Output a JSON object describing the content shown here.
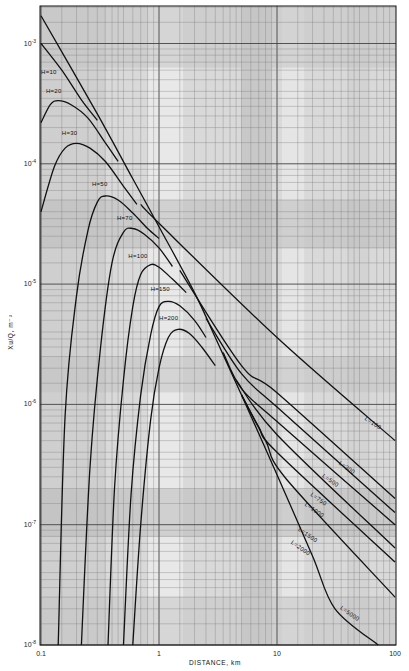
{
  "chart_data": {
    "type": "line",
    "title": "",
    "xlabel": "DISTANCE, km",
    "ylabel": "Xu/Q, m^-2",
    "xscale": "log",
    "yscale": "log",
    "xlim": [
      0.1,
      100
    ],
    "ylim": [
      1e-08,
      0.002
    ],
    "grid": true,
    "legend": "none (curves labeled inline)",
    "x_ticks": [
      {
        "value": 0.1,
        "label": "0.1"
      },
      {
        "value": 1,
        "label": "1"
      },
      {
        "value": 10,
        "label": "10"
      },
      {
        "value": 100,
        "label": "100"
      }
    ],
    "y_ticks": [
      {
        "value": 0.001,
        "base": "10",
        "exp": "-3"
      },
      {
        "value": 0.0001,
        "base": "10",
        "exp": "-4"
      },
      {
        "value": 1e-05,
        "base": "10",
        "exp": "-5"
      },
      {
        "value": 1e-06,
        "base": "10",
        "exp": "-6"
      },
      {
        "value": 1e-07,
        "base": "10",
        "exp": "-7"
      },
      {
        "value": 1e-08,
        "base": "10",
        "exp": "-8"
      }
    ],
    "series": [
      {
        "name": "Envelope (ground level)",
        "label": "",
        "points": [
          [
            0.1,
            0.0017
          ],
          [
            0.3,
            0.00026
          ],
          [
            0.6,
            7.5e-05
          ],
          [
            1,
            3e-05
          ],
          [
            2,
            8.5e-06
          ],
          [
            3,
            3.6e-06
          ],
          [
            5,
            1.2e-06
          ]
        ]
      },
      {
        "name": "H=10",
        "label": "H=10",
        "label_at": [
          0.1,
          0.00056
        ],
        "points": [
          [
            0.1,
            0.001
          ],
          [
            0.15,
            0.0006
          ],
          [
            0.22,
            0.00034
          ],
          [
            0.3,
            0.00023
          ]
        ]
      },
      {
        "name": "H=20",
        "label": "H=20",
        "label_at": [
          0.11,
          0.00039
        ],
        "points": [
          [
            0.1,
            0.00022
          ],
          [
            0.12,
            0.00031
          ],
          [
            0.14,
            0.000335
          ],
          [
            0.18,
            0.00031
          ],
          [
            0.25,
            0.00024
          ],
          [
            0.35,
            0.00015
          ],
          [
            0.45,
            0.000105
          ]
        ]
      },
      {
        "name": "H=30",
        "label": "H=30",
        "label_at": [
          0.15,
          0.000175
        ],
        "points": [
          [
            0.1,
            4e-05
          ],
          [
            0.13,
            9.5e-05
          ],
          [
            0.16,
            0.000135
          ],
          [
            0.2,
            0.000148
          ],
          [
            0.26,
            0.000135
          ],
          [
            0.35,
            0.000105
          ],
          [
            0.5,
            6.5e-05
          ],
          [
            0.65,
            4.6e-05
          ]
        ]
      },
      {
        "name": "H=50",
        "label": "H=50",
        "label_at": [
          0.27,
          6.5e-05
        ],
        "points": [
          [
            0.14,
            1e-08
          ],
          [
            0.16,
            8e-07
          ],
          [
            0.2,
            8e-06
          ],
          [
            0.25,
            2.8e-05
          ],
          [
            0.3,
            4.8e-05
          ],
          [
            0.35,
            5.4e-05
          ],
          [
            0.45,
            5e-05
          ],
          [
            0.6,
            3.9e-05
          ],
          [
            0.8,
            2.9e-05
          ],
          [
            1.0,
            2.4e-05
          ]
        ]
      },
      {
        "name": "H=70",
        "label": "H=70",
        "label_at": [
          0.44,
          3.4e-05
        ],
        "points": [
          [
            0.22,
            1e-08
          ],
          [
            0.26,
            3e-07
          ],
          [
            0.32,
            3e-06
          ],
          [
            0.4,
            1.5e-05
          ],
          [
            0.5,
            2.7e-05
          ],
          [
            0.6,
            2.9e-05
          ],
          [
            0.75,
            2.6e-05
          ],
          [
            1.0,
            2e-05
          ],
          [
            1.3,
            1.4e-05
          ]
        ]
      },
      {
        "name": "H=100",
        "label": "H=100",
        "label_at": [
          0.55,
          1.65e-05
        ],
        "points": [
          [
            0.37,
            1e-08
          ],
          [
            0.42,
            2e-07
          ],
          [
            0.5,
            1.6e-06
          ],
          [
            0.6,
            6.5e-06
          ],
          [
            0.7,
            1.2e-05
          ],
          [
            0.85,
            1.45e-05
          ],
          [
            1.0,
            1.38e-05
          ],
          [
            1.3,
            1.1e-05
          ],
          [
            1.7,
            8.5e-06
          ]
        ]
      },
      {
        "name": "H=150",
        "label": "H=150",
        "label_at": [
          0.85,
          8.8e-06
        ],
        "points": [
          [
            0.5,
            1e-08
          ],
          [
            0.58,
            1.8e-07
          ],
          [
            0.7,
            1.2e-06
          ],
          [
            0.85,
            3.8e-06
          ],
          [
            1.0,
            6.5e-06
          ],
          [
            1.2,
            7.2e-06
          ],
          [
            1.5,
            6.6e-06
          ],
          [
            2.0,
            5e-06
          ],
          [
            2.5,
            3.6e-06
          ]
        ]
      },
      {
        "name": "H=200",
        "label": "H=200",
        "label_at": [
          1.0,
          5e-06
        ],
        "points": [
          [
            0.6,
            1e-08
          ],
          [
            0.7,
            1e-07
          ],
          [
            0.85,
            7.5e-07
          ],
          [
            1.0,
            2e-06
          ],
          [
            1.2,
            3.6e-06
          ],
          [
            1.45,
            4.2e-06
          ],
          [
            1.8,
            3.9e-06
          ],
          [
            2.3,
            3e-06
          ],
          [
            3.0,
            2.1e-06
          ]
        ]
      },
      {
        "name": "L=100",
        "label": "L=100",
        "label_at": [
          55,
          7.5e-07
        ],
        "points": [
          [
            0.7,
            4.6e-05
          ],
          [
            1,
            3.2e-05
          ],
          [
            10,
            3.6e-06
          ],
          [
            100,
            5e-07
          ]
        ]
      },
      {
        "name": "L=300",
        "label": "L=300",
        "label_at": [
          33,
          3.2e-07
        ],
        "points": [
          [
            1.5,
            1.3e-05
          ],
          [
            5,
            2.1e-06
          ],
          [
            10,
            1.25e-06
          ],
          [
            100,
            1.65e-07
          ]
        ]
      },
      {
        "name": "L=500",
        "label": "L=500",
        "label_at": [
          24,
          2.5e-07
        ],
        "points": [
          [
            2.5,
            5.2e-06
          ],
          [
            5,
            1.8e-06
          ],
          [
            10,
            9.5e-07
          ],
          [
            100,
            1.26e-07
          ]
        ]
      },
      {
        "name": "L=750",
        "label": "L=750",
        "label_at": [
          19,
          1.75e-07
        ],
        "points": [
          [
            3.5,
            2.7e-06
          ],
          [
            5,
            1.35e-06
          ],
          [
            10,
            7.2e-07
          ],
          [
            100,
            1e-07
          ]
        ]
      },
      {
        "name": "L=1000",
        "label": "L=1000",
        "label_at": [
          17,
          1.45e-07
        ],
        "points": [
          [
            4.5,
            1.6e-06
          ],
          [
            10,
            5.6e-07
          ],
          [
            100,
            6.4e-08
          ]
        ]
      },
      {
        "name": "L=1500",
        "label": "L=1500",
        "label_at": [
          15,
          9e-08
        ],
        "points": [
          [
            5,
            1.2e-06
          ],
          [
            7,
            6.5e-07
          ],
          [
            10,
            4e-07
          ],
          [
            100,
            4.9e-08
          ]
        ]
      },
      {
        "name": "L=2000",
        "label": "L=2000",
        "label_at": [
          13,
          7e-08
        ],
        "points": [
          [
            5,
            1.2e-06
          ],
          [
            8,
            5e-07
          ],
          [
            12,
            2.4e-07
          ],
          [
            100,
            2.5e-08
          ]
        ]
      },
      {
        "name": "L=5000",
        "label": "L=5000",
        "label_at": [
          34,
          2e-08
        ],
        "points": [
          [
            5,
            1.2e-06
          ],
          [
            10,
            2.6e-07
          ],
          [
            20,
            5.5e-08
          ],
          [
            31,
            2e-08
          ],
          [
            72,
            1e-08
          ]
        ]
      }
    ]
  },
  "axes": {
    "x_title": "DISTANCE, km",
    "y_title": "Xu/Q, m⁻²"
  }
}
